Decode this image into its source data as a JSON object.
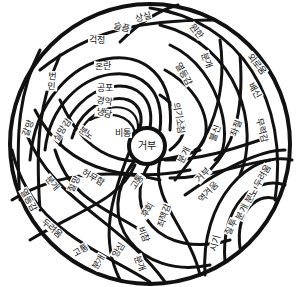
{
  "diagram": {
    "title": "",
    "center_label": "거부",
    "labels": [
      "상실",
      "슬픔",
      "원한",
      "걱정",
      "분개",
      "혼란",
      "열등감",
      "외로움",
      "배신",
      "번민",
      "공포",
      "경악",
      "냉담",
      "의기소침",
      "무력감",
      "좌절",
      "불신",
      "갈망",
      "실망감",
      "분노",
      "비통",
      "분개",
      "거부",
      "역겨움",
      "두려움",
      "분노",
      "분개",
      "질투",
      "시기",
      "허무함",
      "절망",
      "분개",
      "열등감",
      "두려움",
      "고통",
      "분개",
      "고통",
      "후회",
      "죄책감",
      "비참",
      "앙심",
      "분개"
    ],
    "colors": {
      "line": "#111111",
      "background": "#ffffff"
    }
  }
}
